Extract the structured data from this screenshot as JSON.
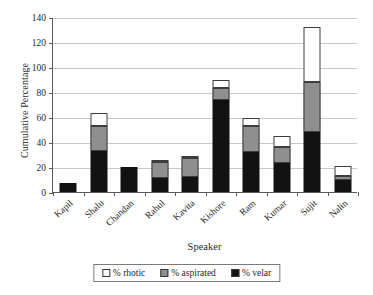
{
  "chart_data": {
    "type": "bar",
    "subtype": "stacked-column",
    "title": "",
    "xlabel": "Speaker",
    "ylabel": "Cumulative Percentage",
    "ylim": [
      0,
      140
    ],
    "ytick_step": 20,
    "yticks": [
      0,
      20,
      40,
      60,
      80,
      100,
      120,
      140
    ],
    "grid": "horizontal",
    "legend_position": "bottom",
    "categories": [
      "Kapil",
      "Shalu",
      "Chandan",
      "Rahul",
      "Kavita",
      "Kishore",
      "Ram",
      "Kumar",
      "Sujit",
      "Nalin"
    ],
    "series": [
      {
        "name": "% velar",
        "color": "#121212",
        "values": [
          7,
          33,
          20,
          11,
          12,
          74,
          32,
          23,
          48,
          10
        ]
      },
      {
        "name": "% aspirated",
        "color": "#8f8f8f",
        "values": [
          0,
          20,
          0,
          13,
          15,
          9,
          21,
          13,
          40,
          3
        ]
      },
      {
        "name": "% rhotic",
        "color": "#ffffff",
        "values": [
          0,
          10,
          0,
          2,
          2,
          7,
          6,
          9,
          44,
          8
        ]
      }
    ],
    "totals": [
      7,
      63,
      20,
      26,
      29,
      90,
      59,
      45,
      132,
      21
    ],
    "stack_order_bottom_to_top": [
      "% velar",
      "% aspirated",
      "% rhotic"
    ]
  },
  "legend": {
    "entries": [
      {
        "label": "% rhotic",
        "swatch": "rhotic"
      },
      {
        "label": "% aspirated",
        "swatch": "aspirated"
      },
      {
        "label": "% velar",
        "swatch": "velar"
      }
    ]
  }
}
